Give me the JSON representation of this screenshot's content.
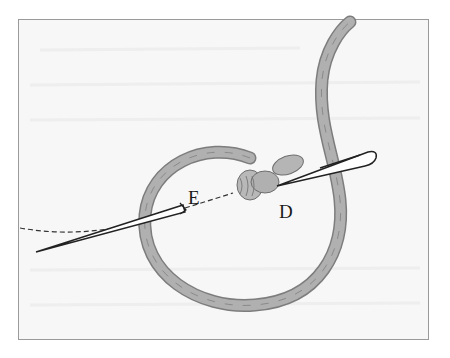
{
  "figure": {
    "labels": [
      {
        "id": "E",
        "text": "E"
      },
      {
        "id": "D",
        "text": "D"
      }
    ],
    "colors": {
      "background": "#f7f7f7",
      "border": "#9a9a9a",
      "thread": "#a9a9a9",
      "thread_dark": "#7d7d7d",
      "needle": "#ffffff",
      "needle_outline": "#222222"
    }
  }
}
